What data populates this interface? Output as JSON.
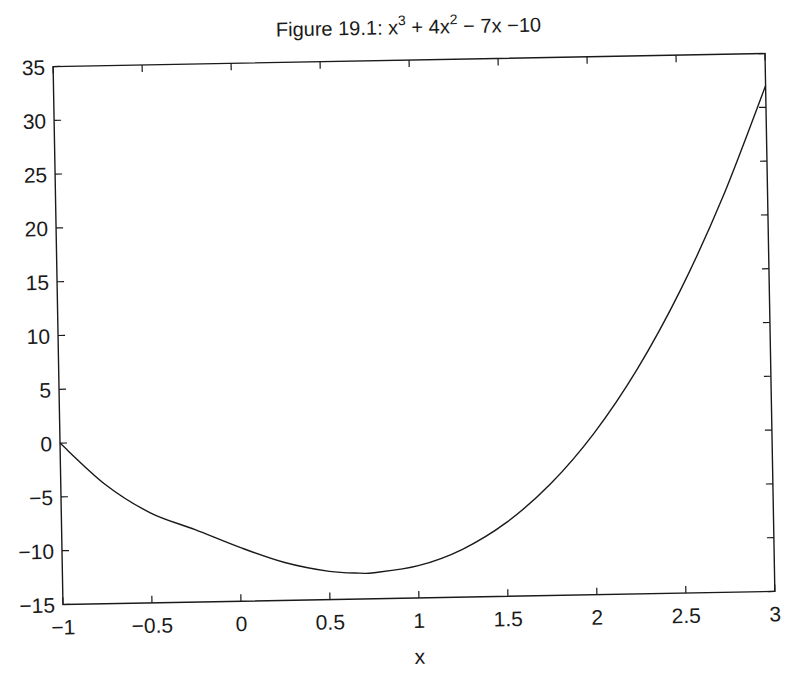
{
  "chart_data": {
    "type": "line",
    "title_parts": {
      "prefix": "Figure 19.1: x",
      "sup1": "3",
      "mid1": " + 4x",
      "sup2": "2",
      "suffix": " − 7x −10"
    },
    "xlabel": "x",
    "ylabel": "",
    "xlim": [
      -1,
      3
    ],
    "ylim": [
      -15,
      35
    ],
    "grid": false,
    "legend": null,
    "x_ticks": [
      -1,
      -0.5,
      0,
      0.5,
      1,
      1.5,
      2,
      2.5,
      3
    ],
    "x_tick_labels": [
      "−1",
      "−0.5",
      "0",
      "0.5",
      "1",
      "1.5",
      "2",
      "2.5",
      "3"
    ],
    "y_ticks": [
      -15,
      -10,
      -5,
      0,
      5,
      10,
      15,
      20,
      25,
      30,
      35
    ],
    "y_tick_labels": [
      "−15",
      "−10",
      "−5",
      "0",
      "5",
      "10",
      "15",
      "20",
      "25",
      "30",
      "35"
    ],
    "series": [
      {
        "name": "x^3 + 4x^2 - 7x - 10",
        "color": "#1a1a1a",
        "x": [
          -1,
          -0.75,
          -0.5,
          -0.25,
          0,
          0.25,
          0.5,
          0.67,
          0.75,
          1,
          1.25,
          1.5,
          1.75,
          2,
          2.25,
          2.5,
          2.75,
          3
        ],
        "y": [
          0,
          -3.92,
          -6.63,
          -8.27,
          -10,
          -11.48,
          -12.38,
          -12.59,
          -12.58,
          -12,
          -10.55,
          -8.13,
          -4.64,
          0,
          5.89,
          13.13,
          21.8,
          32
        ]
      }
    ]
  }
}
